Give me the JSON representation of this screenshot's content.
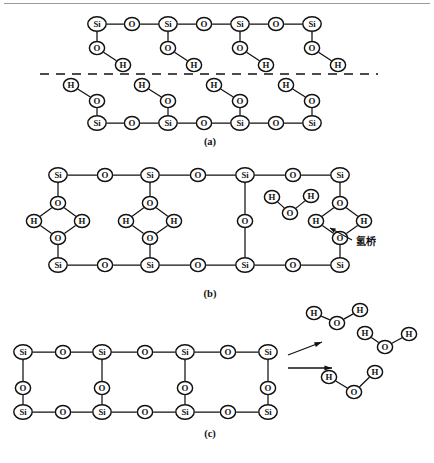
{
  "figure": {
    "atom_labels": {
      "silicon": "Si",
      "oxygen": "O",
      "hydrogen": "H"
    },
    "colors": {
      "stroke": "#111111",
      "atom_fill": "#ffffff",
      "background": "#ffffff",
      "top_rule": "#9a9a9a"
    },
    "panels": [
      {
        "id": "a",
        "caption": "(a)",
        "caption_x": 210,
        "caption_y": 145,
        "description": "Two hydroxylated silica surfaces facing each other across a dashed interface",
        "interface": {
          "x1": 40,
          "x2": 378,
          "y": 74,
          "style": "dashed"
        }
      },
      {
        "id": "b",
        "caption": "(b)",
        "caption_x": 210,
        "caption_y": 297,
        "description": "Hydrogen bridges form between opposing surface hydroxyl groups; one free water molecule present",
        "annotation": {
          "text": "氢桥",
          "x": 356,
          "y": 245,
          "leader_from_x": 352,
          "leader_from_y": 240,
          "leader_to_x": 330,
          "leader_to_y": 228
        }
      },
      {
        "id": "c",
        "caption": "(c)",
        "caption_x": 210,
        "caption_y": 437,
        "description": "Condensed siloxane network after dehydration, releasing free water molecules"
      }
    ],
    "panel_a": {
      "upper": {
        "backbone_y": 24,
        "pendant_o_y": 48,
        "pendant_h_y": 65,
        "si_x": [
          97,
          168,
          240,
          312
        ],
        "bridge_o_x": [
          132,
          204,
          276
        ],
        "pendant_h_dx": 26
      },
      "lower": {
        "backbone_y": 123,
        "pendant_o_y": 101,
        "pendant_h_y": 85,
        "si_x": [
          97,
          168,
          240,
          312
        ],
        "bridge_o_x": [
          132,
          204,
          276
        ],
        "pendant_h_dx": -26
      }
    },
    "panel_b": {
      "top_backbone_y": 175,
      "bottom_backbone_y": 265,
      "si_x": [
        58,
        150,
        245,
        340
      ],
      "bridge_o_x": [
        105,
        198,
        293
      ],
      "rhombus_columns": [
        58,
        150,
        340
      ],
      "rhombus": {
        "o_top_y": 203,
        "o_bottom_y": 238,
        "h_left_dx": -24,
        "h_right_dx": 24,
        "h_y": 221
      },
      "vertical_column": {
        "si_x": 245,
        "o_y": 221
      },
      "free_water": {
        "o_x": 290,
        "o_y": 213,
        "h1_x": 272,
        "h1_y": 197,
        "h2_x": 311,
        "h2_y": 196
      }
    },
    "panel_c": {
      "top_backbone_y": 352,
      "mid_o_y": 388,
      "bottom_backbone_y": 412,
      "si_x": [
        23,
        102,
        185,
        268
      ],
      "bridge_o_x_top": [
        63,
        145,
        228
      ],
      "bridge_o_x_bottom": [
        63,
        145,
        228
      ],
      "vertical_o_si_x": [
        23,
        102,
        185,
        268
      ],
      "arrows": [
        {
          "type": "diagonal",
          "x1": 288,
          "y1": 355,
          "x2": 322,
          "y2": 342
        },
        {
          "type": "horizontal",
          "x1": 288,
          "y1": 368,
          "x2": 332,
          "y2": 368
        }
      ],
      "water_molecules": [
        {
          "o_x": 337,
          "o_y": 323,
          "h1_x": 314,
          "h1_y": 313,
          "h2_x": 360,
          "h2_y": 310
        },
        {
          "o_x": 385,
          "o_y": 347,
          "h1_x": 365,
          "h1_y": 333,
          "h2_x": 409,
          "h2_y": 334
        },
        {
          "o_x": 354,
          "o_y": 392,
          "h1_x": 329,
          "h1_y": 377,
          "h2_x": 375,
          "h2_y": 372
        }
      ]
    }
  }
}
